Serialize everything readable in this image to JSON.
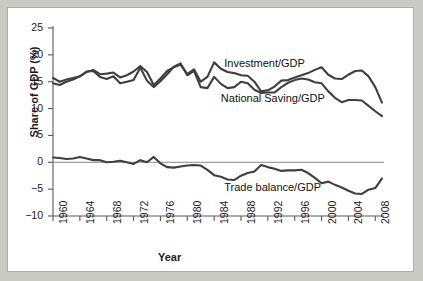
{
  "figure": {
    "background_color": "#cbcbc6",
    "panel_color": "#ffffff",
    "line_color": "#3f3f3f",
    "zero_line_color": "#8a8a8a"
  },
  "chart_data": {
    "type": "line",
    "title": "",
    "xlabel": "Year",
    "ylabel": "Share of GDP (%)",
    "xlim": [
      1960,
      2009
    ],
    "ylim": [
      -10,
      25
    ],
    "xticks": [
      1960,
      1964,
      1968,
      1972,
      1976,
      1980,
      1984,
      1988,
      1992,
      1996,
      2000,
      2004,
      2008
    ],
    "xtick_labels": [
      "1960",
      "1964",
      "1968",
      "1972",
      "1976",
      "1980",
      "1984",
      "1988",
      "1992",
      "1996",
      "2000",
      "2004",
      "2008"
    ],
    "yticks": [
      -10,
      -5,
      0,
      5,
      10,
      15,
      20,
      25
    ],
    "ytick_labels": [
      "−10",
      "−5",
      "0",
      "5",
      "10",
      "15",
      "20",
      "25"
    ],
    "grid": false,
    "legend_position": "inline-annotations",
    "annotations": [
      {
        "text": "Investment/GDP",
        "x": 1985.5,
        "y": 18.2
      },
      {
        "text": "National Saving/GDP",
        "x": 1985.0,
        "y": 11.6
      },
      {
        "text": "Trade balance/GDP",
        "x": 1985.5,
        "y": -4.9
      }
    ],
    "x": [
      1960,
      1961,
      1962,
      1963,
      1964,
      1965,
      1966,
      1967,
      1968,
      1969,
      1970,
      1971,
      1972,
      1973,
      1974,
      1975,
      1976,
      1977,
      1978,
      1979,
      1980,
      1981,
      1982,
      1983,
      1984,
      1985,
      1986,
      1987,
      1988,
      1989,
      1990,
      1991,
      1992,
      1993,
      1994,
      1995,
      1996,
      1997,
      1998,
      1999,
      2000,
      2001,
      2002,
      2003,
      2004,
      2005,
      2006,
      2007,
      2008,
      2009
    ],
    "series": [
      {
        "name": "Investment/GDP",
        "values": [
          15.7,
          15.0,
          15.4,
          15.7,
          16.0,
          16.8,
          17.2,
          16.4,
          16.5,
          16.7,
          15.8,
          16.2,
          16.9,
          17.9,
          16.8,
          14.4,
          15.6,
          17.0,
          17.7,
          18.2,
          16.4,
          17.3,
          15.0,
          15.9,
          18.6,
          17.4,
          16.8,
          16.6,
          16.2,
          16.1,
          15.0,
          13.2,
          13.4,
          14.1,
          15.2,
          15.3,
          15.8,
          16.2,
          16.6,
          17.2,
          17.7,
          16.3,
          15.6,
          15.5,
          16.3,
          17.0,
          17.1,
          16.0,
          14.0,
          11.1
        ]
      },
      {
        "name": "National Saving/GDP",
        "values": [
          14.7,
          14.4,
          15.0,
          15.4,
          16.0,
          16.9,
          17.0,
          15.9,
          15.5,
          16.0,
          14.7,
          15.0,
          15.3,
          17.6,
          15.2,
          14.0,
          15.1,
          16.4,
          17.8,
          18.4,
          16.2,
          17.0,
          14.0,
          13.8,
          15.9,
          14.6,
          13.8,
          14.0,
          15.0,
          14.7,
          13.5,
          12.9,
          13.0,
          13.0,
          14.0,
          14.8,
          15.3,
          15.6,
          15.4,
          14.9,
          14.7,
          13.2,
          12.0,
          11.2,
          11.6,
          11.6,
          11.5,
          10.5,
          9.5,
          8.6
        ]
      },
      {
        "name": "Trade balance/GDP",
        "values": [
          0.9,
          0.8,
          0.6,
          0.7,
          1.0,
          0.7,
          0.4,
          0.4,
          0.0,
          0.1,
          0.3,
          0.0,
          -0.3,
          0.4,
          0.0,
          1.0,
          -0.2,
          -0.9,
          -1.0,
          -0.8,
          -0.6,
          -0.5,
          -0.6,
          -1.4,
          -2.4,
          -2.7,
          -3.2,
          -3.3,
          -2.5,
          -2.0,
          -1.7,
          -0.5,
          -0.9,
          -1.2,
          -1.6,
          -1.5,
          -1.5,
          -1.4,
          -2.0,
          -2.9,
          -3.9,
          -3.6,
          -4.2,
          -4.7,
          -5.3,
          -5.8,
          -5.9,
          -5.1,
          -4.8,
          -3.0
        ]
      }
    ]
  }
}
